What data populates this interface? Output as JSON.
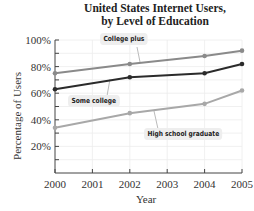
{
  "chart_data": {
    "type": "line",
    "title": "United States Internet Users, by Level of Education",
    "title_lines": [
      "United States Internet Users,",
      "by Level of Education"
    ],
    "xlabel": "Year",
    "ylabel": "Percentage of Users",
    "x": [
      2000,
      2002,
      2004,
      2005
    ],
    "x_ticks": [
      "2000",
      "2001",
      "2002",
      "2003",
      "2004",
      "2005"
    ],
    "y_ticks": [
      "20%",
      "40%",
      "60%",
      "80%",
      "100%"
    ],
    "ylim": [
      0,
      100
    ],
    "grid": true,
    "series": [
      {
        "name": "College plus",
        "values": [
          75,
          82,
          88,
          92
        ],
        "color": "#8a8a8a"
      },
      {
        "name": "Some college",
        "values": [
          63,
          72,
          75,
          82
        ],
        "color": "#2b2b2b"
      },
      {
        "name": "High school graduate",
        "values": [
          34,
          45,
          52,
          62
        ],
        "color": "#a8a8a8"
      }
    ],
    "legend_position": "inline callouts"
  }
}
